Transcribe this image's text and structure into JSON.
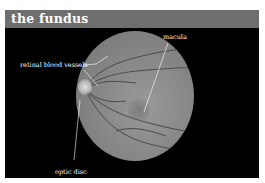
{
  "header": {
    "title": "the fundus"
  },
  "labels": {
    "macula": "macula",
    "retinal_blood_vessels": "retinal blood vessels",
    "optic_disc": "optic disc"
  },
  "colors": {
    "header_bg": "#6e6e6e",
    "frame_bg": "#000000",
    "text": "#ffffff"
  }
}
